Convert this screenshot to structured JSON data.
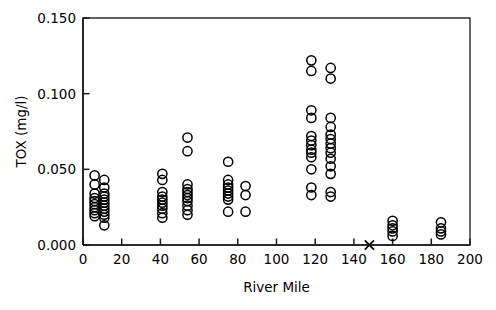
{
  "chart_data": {
    "type": "scatter",
    "title": "",
    "xlabel": "River Mile",
    "ylabel": "TOX (mg/l)",
    "xlim": [
      0,
      200
    ],
    "ylim": [
      0.0,
      0.15
    ],
    "xticks": [
      0,
      20,
      40,
      60,
      80,
      100,
      120,
      140,
      160,
      180,
      200
    ],
    "xtick_labels": [
      "0",
      "20",
      "40",
      "60",
      "80",
      "100",
      "120",
      "140",
      "160",
      "180",
      "200"
    ],
    "yticks": [
      0.0,
      0.05,
      0.1,
      0.15
    ],
    "ytick_labels": [
      "0.000",
      "0.050",
      "0.100",
      "0.150"
    ],
    "grid": false,
    "legend": null,
    "marker": "open-circle",
    "series": [
      {
        "name": "TOX samples",
        "marker": "open-circle",
        "points": [
          [
            6,
            0.046
          ],
          [
            6,
            0.04
          ],
          [
            6,
            0.034
          ],
          [
            6,
            0.031
          ],
          [
            6,
            0.029
          ],
          [
            6,
            0.027
          ],
          [
            6,
            0.025
          ],
          [
            6,
            0.023
          ],
          [
            6,
            0.021
          ],
          [
            6,
            0.019
          ],
          [
            11,
            0.043
          ],
          [
            11,
            0.038
          ],
          [
            11,
            0.034
          ],
          [
            11,
            0.032
          ],
          [
            11,
            0.03
          ],
          [
            11,
            0.028
          ],
          [
            11,
            0.026
          ],
          [
            11,
            0.024
          ],
          [
            11,
            0.022
          ],
          [
            11,
            0.02
          ],
          [
            11,
            0.018
          ],
          [
            11,
            0.013
          ],
          [
            41,
            0.047
          ],
          [
            41,
            0.043
          ],
          [
            41,
            0.035
          ],
          [
            41,
            0.032
          ],
          [
            41,
            0.03
          ],
          [
            41,
            0.028
          ],
          [
            41,
            0.026
          ],
          [
            41,
            0.024
          ],
          [
            41,
            0.021
          ],
          [
            41,
            0.018
          ],
          [
            54,
            0.071
          ],
          [
            54,
            0.062
          ],
          [
            54,
            0.04
          ],
          [
            54,
            0.037
          ],
          [
            54,
            0.035
          ],
          [
            54,
            0.033
          ],
          [
            54,
            0.031
          ],
          [
            54,
            0.029
          ],
          [
            54,
            0.026
          ],
          [
            54,
            0.023
          ],
          [
            54,
            0.02
          ],
          [
            75,
            0.055
          ],
          [
            75,
            0.043
          ],
          [
            75,
            0.04
          ],
          [
            75,
            0.038
          ],
          [
            75,
            0.036
          ],
          [
            75,
            0.034
          ],
          [
            75,
            0.032
          ],
          [
            75,
            0.03
          ],
          [
            75,
            0.022
          ],
          [
            84,
            0.039
          ],
          [
            84,
            0.033
          ],
          [
            84,
            0.022
          ],
          [
            118,
            0.122
          ],
          [
            118,
            0.115
          ],
          [
            118,
            0.089
          ],
          [
            118,
            0.084
          ],
          [
            118,
            0.072
          ],
          [
            118,
            0.069
          ],
          [
            118,
            0.066
          ],
          [
            118,
            0.063
          ],
          [
            118,
            0.061
          ],
          [
            118,
            0.058
          ],
          [
            118,
            0.05
          ],
          [
            118,
            0.038
          ],
          [
            118,
            0.033
          ],
          [
            128,
            0.117
          ],
          [
            128,
            0.11
          ],
          [
            128,
            0.084
          ],
          [
            128,
            0.078
          ],
          [
            128,
            0.073
          ],
          [
            128,
            0.07
          ],
          [
            128,
            0.067
          ],
          [
            128,
            0.064
          ],
          [
            128,
            0.061
          ],
          [
            128,
            0.057
          ],
          [
            128,
            0.052
          ],
          [
            128,
            0.047
          ],
          [
            128,
            0.035
          ],
          [
            128,
            0.032
          ],
          [
            160,
            0.016
          ],
          [
            160,
            0.013
          ],
          [
            160,
            0.011
          ],
          [
            160,
            0.009
          ],
          [
            160,
            0.006
          ],
          [
            185,
            0.015
          ],
          [
            185,
            0.011
          ],
          [
            185,
            0.009
          ],
          [
            185,
            0.007
          ]
        ]
      },
      {
        "name": "non-detect",
        "marker": "x",
        "points": [
          [
            148,
            0.0
          ]
        ]
      }
    ]
  },
  "axes": {
    "y_title": "TOX (mg/l)",
    "x_title": "River Mile"
  }
}
